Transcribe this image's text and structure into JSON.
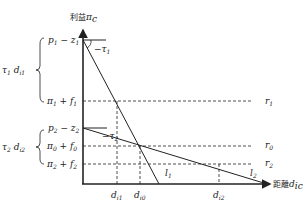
{
  "diagram": {
    "y_axis_label": "利益π_c",
    "y_axis_label_cn": "利益",
    "y_axis_label_sym": "π",
    "y_axis_label_sub": "c",
    "x_axis_label_cn": "距離",
    "x_axis_label_sym": "d",
    "x_axis_label_sub": "ic",
    "y_labels": [
      {
        "id": "p1-z1",
        "base": "p",
        "sub": "1",
        "op": " − ",
        "base2": "z",
        "sub2": "1"
      },
      {
        "id": "pi1+f1",
        "base": "π",
        "sub": "1",
        "op": " + ",
        "base2": "f",
        "sub2": "1"
      },
      {
        "id": "p2-z2",
        "base": "p",
        "sub": "2",
        "op": " − ",
        "base2": "z",
        "sub2": "2"
      },
      {
        "id": "pi0+f0",
        "base": "π",
        "sub": "0",
        "op": " + ",
        "base2": "f",
        "sub2": "0"
      },
      {
        "id": "pi2+f2",
        "base": "π",
        "sub": "2",
        "op": " + ",
        "base2": "f",
        "sub2": "2"
      }
    ],
    "braces": [
      {
        "label_base": "τ",
        "label_sub": "1",
        "label_base2": "d",
        "label_sub2": "i1"
      },
      {
        "label_base": "τ",
        "label_sub": "2",
        "label_base2": "d",
        "label_sub2": "i2"
      }
    ],
    "slopes": [
      {
        "text": "−τ",
        "sub": "1"
      },
      {
        "text": "−τ",
        "sub": "2"
      }
    ],
    "right_labels": [
      {
        "base": "r",
        "sub": "1"
      },
      {
        "base": "r",
        "sub": "0"
      },
      {
        "base": "r",
        "sub": "2"
      }
    ],
    "x_labels": [
      {
        "base": "d",
        "sub": "i1"
      },
      {
        "base": "d",
        "sub": "i0"
      },
      {
        "base": "d",
        "sub": "i2"
      }
    ],
    "lines": [
      {
        "base": "l",
        "sub": "1"
      },
      {
        "base": "l",
        "sub": "2"
      }
    ],
    "colors": {
      "stroke": "#222222",
      "background": "#ffffff"
    }
  }
}
